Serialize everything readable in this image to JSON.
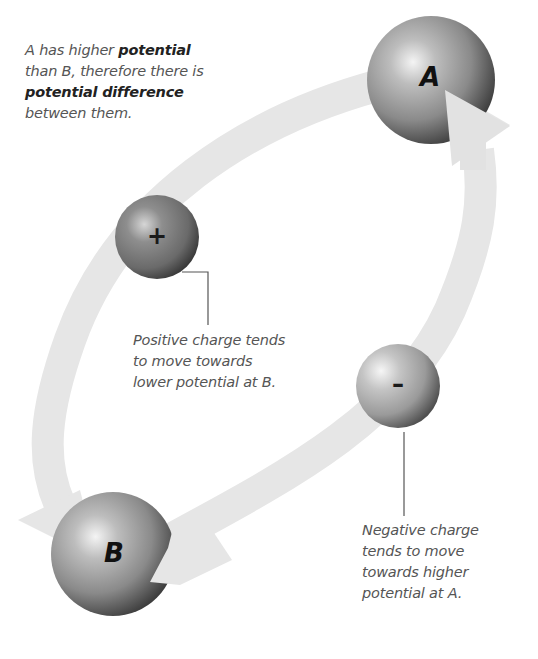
{
  "diagram": {
    "title_note": {
      "line1_prefix": "A has higher ",
      "line1_bold": "potential",
      "line2": "than B, therefore there is",
      "line3_bold": "potential difference",
      "line4": "between them."
    },
    "spheres": {
      "a": {
        "label": "A",
        "role": "higher potential"
      },
      "b": {
        "label": "B",
        "role": "lower potential"
      },
      "positive": {
        "sign": "+",
        "role": "positive charge"
      },
      "negative": {
        "sign": "–",
        "role": "negative charge"
      }
    },
    "callouts": {
      "positive": {
        "line1": "Positive charge tends",
        "line2": "to move towards",
        "line3": "lower potential at B."
      },
      "negative": {
        "line1": "Negative charge",
        "line2": "tends to move",
        "line3": "towards higher",
        "line4": "potential at A."
      }
    },
    "colors": {
      "arrow_band": "#e6e6e6",
      "sphere_highlight": "#e8e8e8",
      "sphere_mid": "#9a9a9a",
      "sphere_shadow": "#3c3c3c",
      "leader_line": "#555555",
      "caption_text": "#555555"
    }
  }
}
